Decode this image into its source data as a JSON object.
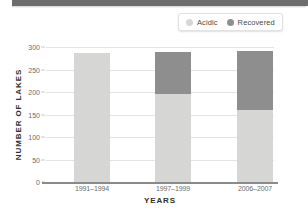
{
  "chart_data": {
    "type": "bar",
    "subtype": "stacked",
    "title": "",
    "xlabel": "YEARS",
    "ylabel": "NUMBER OF LAKES",
    "categories": [
      "1991–1994",
      "1997–1999",
      "2006–2007"
    ],
    "series": [
      {
        "name": "Acidic",
        "color": "#d6d6d4",
        "values": [
          286,
          196,
          160
        ]
      },
      {
        "name": "Recovered",
        "color": "#8e8e8e",
        "values": [
          0,
          93,
          132
        ]
      }
    ],
    "totals": [
      286,
      289,
      292
    ],
    "ylim": [
      0,
      300
    ],
    "yticks": [
      0,
      50,
      100,
      150,
      200,
      250,
      300
    ],
    "ytick_labels": [
      "0",
      "50",
      "100",
      "150",
      "200",
      "250",
      "300"
    ],
    "grid": true,
    "legend_position": "top-right"
  },
  "legend": {
    "items": [
      {
        "label": "Acidic",
        "color": "#d6d6d4"
      },
      {
        "label": "Recovered",
        "color": "#8e8e8e"
      }
    ]
  }
}
